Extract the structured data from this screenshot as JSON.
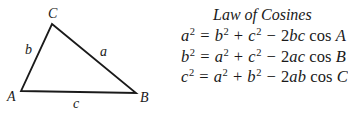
{
  "diagram": {
    "type": "triangle",
    "vertices": [
      {
        "name": "A",
        "x": 21,
        "y": 91,
        "label_x": 7,
        "label_y": 101
      },
      {
        "name": "B",
        "x": 136,
        "y": 93,
        "label_x": 140,
        "label_y": 102
      },
      {
        "name": "C",
        "x": 52,
        "y": 24,
        "label_x": 48,
        "label_y": 18
      }
    ],
    "sides": [
      {
        "name": "a",
        "between": [
          "B",
          "C"
        ],
        "label_x": 100,
        "label_y": 56
      },
      {
        "name": "b",
        "between": [
          "A",
          "C"
        ],
        "label_x": 25,
        "label_y": 54
      },
      {
        "name": "c",
        "between": [
          "A",
          "B"
        ],
        "label_x": 73,
        "label_y": 108
      }
    ],
    "stroke_color": "#1a1a1a"
  },
  "formulas": {
    "title": "Law of Cosines",
    "equations": [
      {
        "lhs": "a",
        "t1": "b",
        "t2": "c",
        "coef": "2",
        "prod": "bc",
        "fn": "cos",
        "angle": "A"
      },
      {
        "lhs": "b",
        "t1": "a",
        "t2": "c",
        "coef": "2",
        "prod": "ac",
        "fn": "cos",
        "angle": "B"
      },
      {
        "lhs": "c",
        "t1": "a",
        "t2": "b",
        "coef": "2",
        "prod": "ab",
        "fn": "cos",
        "angle": "C"
      }
    ],
    "exponent": "2",
    "ops": {
      "eq": "=",
      "plus": "+",
      "minus": "−"
    }
  }
}
